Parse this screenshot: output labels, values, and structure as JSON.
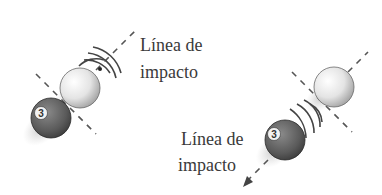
{
  "figure": {
    "left_panel": {
      "label_line1": "Línea de",
      "label_line2": "impacto",
      "ball_number": "3"
    },
    "right_panel": {
      "label_line1": "Línea de",
      "label_line2": "impacto",
      "ball_number": "3"
    }
  },
  "colors": {
    "cue_ball": "#e8e8e8",
    "object_ball": "#5a5a5a",
    "dash_line": "#555555",
    "text": "#3a3a3a"
  }
}
